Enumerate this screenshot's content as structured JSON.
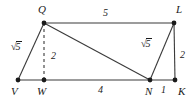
{
  "figure": {
    "type": "geometry-diagram",
    "stroke_color": "#3a3a3a",
    "label_color": "#1a1a1a",
    "background": "#ffffff",
    "vertices": [
      {
        "id": "V",
        "label": "V",
        "x": 18,
        "y": 80,
        "label_x": 11,
        "label_y": 86
      },
      {
        "id": "W",
        "label": "W",
        "x": 44,
        "y": 80,
        "label_x": 37,
        "label_y": 86
      },
      {
        "id": "Q",
        "label": "Q",
        "x": 44,
        "y": 23,
        "label_x": 38,
        "label_y": 4
      },
      {
        "id": "L",
        "label": "L",
        "x": 174,
        "y": 23,
        "label_x": 176,
        "label_y": 4
      },
      {
        "id": "N",
        "label": "N",
        "x": 150,
        "y": 80,
        "label_x": 145,
        "label_y": 86
      },
      {
        "id": "K",
        "label": "K",
        "x": 175,
        "y": 80,
        "label_x": 178,
        "label_y": 86
      }
    ],
    "edges": [
      {
        "id": "VQ",
        "from": "V",
        "to": "Q",
        "style": "solid"
      },
      {
        "id": "QL",
        "from": "Q",
        "to": "L",
        "style": "solid"
      },
      {
        "id": "LK",
        "from": "L",
        "to": "K",
        "style": "solid"
      },
      {
        "id": "VK",
        "from": "V",
        "to": "K",
        "style": "solid"
      },
      {
        "id": "QW",
        "from": "Q",
        "to": "W",
        "style": "dashed"
      },
      {
        "id": "QN",
        "from": "Q",
        "to": "N",
        "style": "solid"
      },
      {
        "id": "NL",
        "from": "N",
        "to": "L",
        "style": "solid"
      }
    ],
    "measures": [
      {
        "id": "VQ-len",
        "edge": "VQ",
        "kind": "radical",
        "radicand": "5",
        "x": 11,
        "y": 41
      },
      {
        "id": "QL-len",
        "edge": "QL",
        "kind": "number",
        "text": "5",
        "x": 103,
        "y": 8
      },
      {
        "id": "QW-len",
        "edge": "QW",
        "kind": "number",
        "text": "2",
        "x": 51,
        "y": 51
      },
      {
        "id": "NL-len",
        "edge": "NL",
        "kind": "radical",
        "radicand": "5",
        "x": 141,
        "y": 38
      },
      {
        "id": "LK-len",
        "edge": "LK",
        "kind": "number",
        "text": "2",
        "x": 180,
        "y": 50
      },
      {
        "id": "WN-len",
        "edge": "VK",
        "kind": "number",
        "text": "4",
        "x": 98,
        "y": 85
      },
      {
        "id": "NK-len",
        "edge": "VK",
        "kind": "number",
        "text": "1",
        "x": 161,
        "y": 85
      }
    ]
  }
}
